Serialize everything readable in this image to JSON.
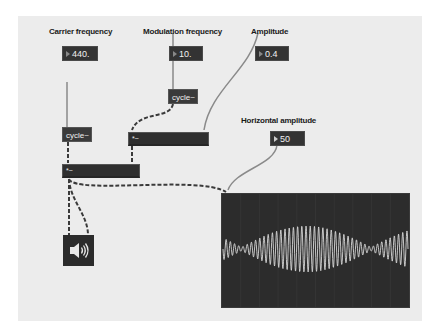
{
  "patch": {
    "labels": {
      "carrier": "Carrier frequency",
      "modulation": "Modulation frequency",
      "amplitude": "Amplitude",
      "horizontal": "Horizontal amplitude"
    },
    "number_boxes": {
      "carrier_value": "440.",
      "modulation_value": "10.",
      "amplitude_value": "0.4",
      "horizontal_value": "50"
    },
    "objects": {
      "carrier_cycle": "cycle~",
      "modulation_cycle": "cycle~",
      "mul_mod": "*~",
      "mul_carrier": "*~"
    },
    "speaker": {
      "icon": "speaker-icon"
    },
    "scope": {
      "name": "scope~",
      "waveform": "amplitude-modulated sine",
      "colors": {
        "background": "#2c2c2c",
        "trace": "#d8d8d8",
        "grid": "#3a3a3a"
      }
    },
    "colors": {
      "canvas": "#ececec",
      "box": "#333333",
      "signal_cord": "#3a3a3a",
      "control_cord": "#8a8a8a"
    }
  }
}
